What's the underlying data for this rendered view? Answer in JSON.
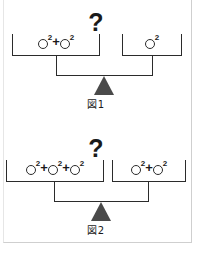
{
  "page": {
    "background_color": "#ffffff",
    "frame_color": "#cfcfcf",
    "ink_color": "#1a1a1a",
    "fulcrum_color": "#4a4a4a"
  },
  "figures": [
    {
      "id": "figure-1",
      "caption": "図1",
      "question_mark": "?",
      "left_pan": {
        "terms": [
          {
            "symbol": "○",
            "exponent": "2"
          },
          {
            "symbol": "○",
            "exponent": "2"
          }
        ],
        "operator": "+",
        "count": 2
      },
      "right_pan": {
        "terms": [
          {
            "symbol": "○",
            "exponent": "2"
          }
        ],
        "operator": "+",
        "count": 1
      }
    },
    {
      "id": "figure-2",
      "caption": "図2",
      "question_mark": "?",
      "left_pan": {
        "terms": [
          {
            "symbol": "○",
            "exponent": "2"
          },
          {
            "symbol": "○",
            "exponent": "2"
          },
          {
            "symbol": "○",
            "exponent": "2"
          }
        ],
        "operator": "+",
        "count": 3
      },
      "right_pan": {
        "terms": [
          {
            "symbol": "○",
            "exponent": "2"
          },
          {
            "symbol": "○",
            "exponent": "2"
          }
        ],
        "operator": "+",
        "count": 2
      }
    }
  ]
}
